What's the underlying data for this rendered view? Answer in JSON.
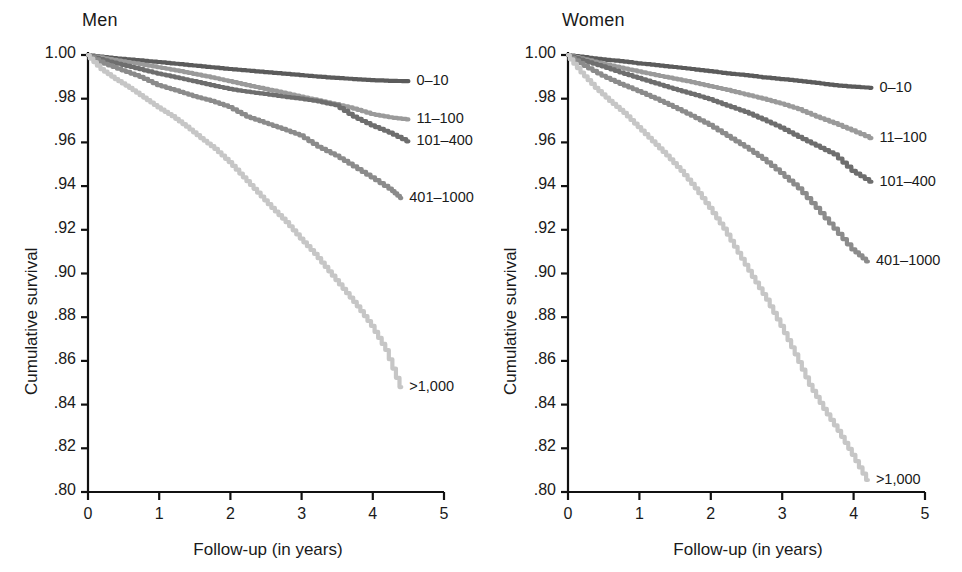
{
  "figure": {
    "background": "#ffffff",
    "width": 962,
    "height": 572
  },
  "panels": [
    {
      "id": "men",
      "title": "Men"
    },
    {
      "id": "women",
      "title": "Women"
    }
  ],
  "axes": {
    "ylabel": "Cumulative survival",
    "xlabel": "Follow-up (in years)",
    "ylim": [
      0.8,
      1.0
    ],
    "xlim": [
      0,
      5
    ],
    "yticks": [
      0.8,
      0.82,
      0.84,
      0.86,
      0.88,
      0.9,
      0.92,
      0.94,
      0.96,
      0.98,
      1.0
    ],
    "ytick_labels": [
      ".80",
      ".82",
      ".84",
      ".86",
      ".88",
      ".90",
      ".92",
      ".94",
      ".96",
      ".98",
      "1.00"
    ],
    "xticks": [
      0,
      1,
      2,
      3,
      4,
      5
    ],
    "xtick_labels": [
      "0",
      "1",
      "2",
      "3",
      "4",
      "5"
    ],
    "grid": false,
    "axis_color": "#111111"
  },
  "legend": {
    "position": "inline-end-of-curve",
    "entries": [
      {
        "label": "0–10",
        "color": "#5b5b5b"
      },
      {
        "label": "11–100",
        "color": "#9a9a9a"
      },
      {
        "label": "101–400",
        "color": "#6e6e6e"
      },
      {
        "label": "401–1000",
        "color": "#8b8b8b"
      },
      {
        "label": ">1,000",
        "color": "#c6c6c6"
      }
    ]
  },
  "chart_data": {
    "type": "line",
    "xlabel": "Follow-up (in years)",
    "ylabel": "Cumulative survival",
    "xlim": [
      0,
      5
    ],
    "ylim": [
      0.8,
      1.0
    ],
    "grid": false,
    "legend_position": "right-of-curves",
    "panels": [
      {
        "name": "Men",
        "series": [
          {
            "name": "0–10",
            "color": "#5b5b5b",
            "label": "0–10",
            "x": [
              0.0,
              0.25,
              0.5,
              0.75,
              1.0,
              1.25,
              1.5,
              1.75,
              2.0,
              2.25,
              2.5,
              2.75,
              3.0,
              3.25,
              3.5,
              3.75,
              4.0,
              4.25,
              4.5
            ],
            "y": [
              1.0,
              0.999,
              0.9982,
              0.9975,
              0.9968,
              0.996,
              0.9952,
              0.9944,
              0.9936,
              0.9929,
              0.9922,
              0.9915,
              0.9908,
              0.9901,
              0.9895,
              0.989,
              0.9885,
              0.9882,
              0.988
            ]
          },
          {
            "name": "11–100",
            "color": "#9a9a9a",
            "label": "11–100",
            "x": [
              0.0,
              0.25,
              0.5,
              0.75,
              1.0,
              1.25,
              1.5,
              1.75,
              2.0,
              2.25,
              2.5,
              2.75,
              3.0,
              3.25,
              3.5,
              3.75,
              4.0,
              4.25,
              4.5
            ],
            "y": [
              1.0,
              0.9985,
              0.9971,
              0.9958,
              0.9944,
              0.993,
              0.9914,
              0.9898,
              0.988,
              0.9862,
              0.9845,
              0.9828,
              0.981,
              0.9792,
              0.9775,
              0.9755,
              0.973,
              0.9715,
              0.9705
            ]
          },
          {
            "name": "101–400",
            "color": "#6e6e6e",
            "label": "101–400",
            "x": [
              0.0,
              0.25,
              0.5,
              0.75,
              1.0,
              1.25,
              1.5,
              1.75,
              2.0,
              2.25,
              2.5,
              2.75,
              3.0,
              3.25,
              3.5,
              3.75,
              4.0,
              4.25,
              4.5
            ],
            "y": [
              1.0,
              0.9975,
              0.9955,
              0.9935,
              0.9915,
              0.9898,
              0.988,
              0.9862,
              0.9845,
              0.9832,
              0.9822,
              0.981,
              0.98,
              0.9788,
              0.977,
              0.9718,
              0.9678,
              0.9645,
              0.9605
            ]
          },
          {
            "name": "401–1000",
            "color": "#8b8b8b",
            "label": "401–1000",
            "x": [
              0.0,
              0.25,
              0.5,
              0.75,
              1.0,
              1.25,
              1.5,
              1.75,
              2.0,
              2.25,
              2.5,
              2.75,
              3.0,
              3.25,
              3.5,
              3.75,
              4.0,
              4.25,
              4.4
            ],
            "y": [
              1.0,
              0.996,
              0.993,
              0.99,
              0.9862,
              0.9838,
              0.9812,
              0.979,
              0.9762,
              0.9718,
              0.969,
              0.9662,
              0.9632,
              0.958,
              0.954,
              0.949,
              0.944,
              0.9388,
              0.9345
            ]
          },
          {
            "name": ">1,000",
            "color": "#c6c6c6",
            "label": ">1,000",
            "x": [
              0.0,
              0.2,
              0.4,
              0.6,
              0.8,
              1.0,
              1.2,
              1.4,
              1.6,
              1.8,
              2.0,
              2.2,
              2.4,
              2.6,
              2.8,
              3.0,
              3.2,
              3.4,
              3.6,
              3.8,
              4.0,
              4.2,
              4.4
            ],
            "y": [
              1.0,
              0.9935,
              0.989,
              0.985,
              0.9805,
              0.976,
              0.972,
              0.9672,
              0.962,
              0.957,
              0.951,
              0.944,
              0.937,
              0.93,
              0.9235,
              0.916,
              0.909,
              0.901,
              0.893,
              0.885,
              0.876,
              0.865,
              0.848
            ]
          }
        ]
      },
      {
        "name": "Women",
        "series": [
          {
            "name": "0–10",
            "color": "#5b5b5b",
            "label": "0–10",
            "x": [
              0.0,
              0.25,
              0.5,
              0.75,
              1.0,
              1.25,
              1.5,
              1.75,
              2.0,
              2.25,
              2.5,
              2.75,
              3.0,
              3.25,
              3.5,
              3.75,
              4.0,
              4.25
            ],
            "y": [
              1.0,
              0.999,
              0.998,
              0.9972,
              0.9962,
              0.9954,
              0.9945,
              0.9936,
              0.9926,
              0.9916,
              0.9908,
              0.9898,
              0.989,
              0.9882,
              0.9872,
              0.9862,
              0.9855,
              0.985
            ]
          },
          {
            "name": "11–100",
            "color": "#9a9a9a",
            "label": "11–100",
            "x": [
              0.0,
              0.25,
              0.5,
              0.75,
              1.0,
              1.25,
              1.5,
              1.75,
              2.0,
              2.25,
              2.5,
              2.75,
              3.0,
              3.25,
              3.5,
              3.75,
              4.0,
              4.25
            ],
            "y": [
              1.0,
              0.998,
              0.996,
              0.9942,
              0.9925,
              0.9908,
              0.9892,
              0.9876,
              0.9858,
              0.984,
              0.982,
              0.98,
              0.9778,
              0.9752,
              0.9718,
              0.9688,
              0.9655,
              0.962
            ]
          },
          {
            "name": "101–400",
            "color": "#6e6e6e",
            "label": "101–400",
            "x": [
              0.0,
              0.25,
              0.5,
              0.75,
              1.0,
              1.25,
              1.5,
              1.75,
              2.0,
              2.25,
              2.5,
              2.75,
              3.0,
              3.25,
              3.5,
              3.75,
              4.0,
              4.25
            ],
            "y": [
              1.0,
              0.9972,
              0.9948,
              0.992,
              0.9895,
              0.987,
              0.9845,
              0.9822,
              0.9798,
              0.9768,
              0.974,
              0.9705,
              0.9668,
              0.9625,
              0.9585,
              0.9545,
              0.947,
              0.942
            ]
          },
          {
            "name": "401–1000",
            "color": "#8b8b8b",
            "label": "401–1000",
            "x": [
              0.0,
              0.25,
              0.5,
              0.75,
              1.0,
              1.25,
              1.5,
              1.75,
              2.0,
              2.25,
              2.5,
              2.75,
              3.0,
              3.25,
              3.5,
              3.75,
              4.0,
              4.2
            ],
            "y": [
              1.0,
              0.995,
              0.9905,
              0.9868,
              0.9835,
              0.98,
              0.9762,
              0.9722,
              0.968,
              0.963,
              0.958,
              0.9525,
              0.946,
              0.939,
              0.93,
              0.9205,
              0.911,
              0.9055
            ]
          },
          {
            "name": ">1,000",
            "color": "#c6c6c6",
            "label": ">1,000",
            "x": [
              0.0,
              0.2,
              0.4,
              0.6,
              0.8,
              1.0,
              1.2,
              1.4,
              1.6,
              1.8,
              2.0,
              2.2,
              2.4,
              2.6,
              2.8,
              3.0,
              3.2,
              3.4,
              3.6,
              3.8,
              4.0,
              4.2
            ],
            "y": [
              1.0,
              0.992,
              0.985,
              0.979,
              0.9735,
              0.967,
              0.9605,
              0.954,
              0.947,
              0.939,
              0.93,
              0.9205,
              0.9095,
              0.8985,
              0.888,
              0.876,
              0.863,
              0.849,
              0.838,
              0.828,
              0.817,
              0.8055
            ]
          }
        ]
      }
    ]
  }
}
